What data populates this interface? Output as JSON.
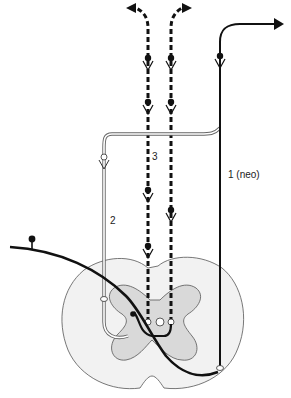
{
  "diagram": {
    "title": "",
    "labels": {
      "pathway_1": "1 (neo)",
      "pathway_2": "2",
      "pathway_3": "3"
    },
    "colors": {
      "background": "#ffffff",
      "stroke": "#111111",
      "white_matter": "#f2f2f2",
      "gray_matter": "#d9d9d9",
      "outline": "#555555"
    },
    "elements": [
      {
        "id": "pathway_1",
        "style": "thick solid black line with arrow to upper right",
        "label": "1 (neo)"
      },
      {
        "id": "pathway_2",
        "style": "double (hollow) line with small open circle terminals",
        "label": "2"
      },
      {
        "id": "pathway_3",
        "style": "two parallel thick dashed lines with synapse markers and arrows up",
        "label": "3"
      },
      {
        "id": "afferent_fiber",
        "style": "thick curved black line entering from left with knob"
      },
      {
        "id": "spinal_cord_cross_section",
        "style": "butterfly gray matter inside white matter outline"
      }
    ]
  }
}
